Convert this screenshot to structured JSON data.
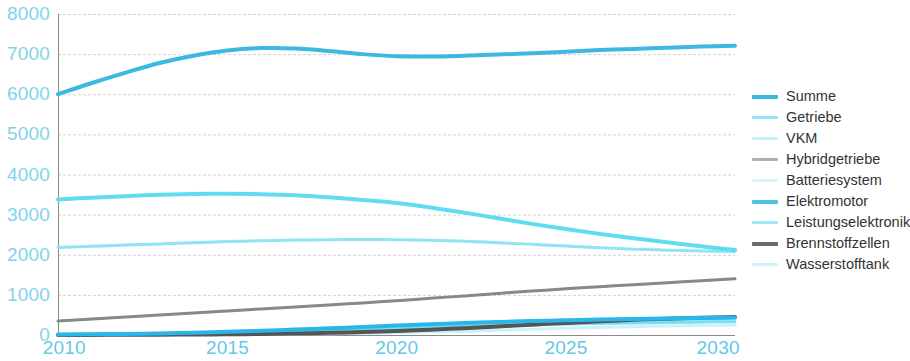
{
  "chart_data": {
    "type": "line",
    "title": "",
    "subtitle": "",
    "xlabel": "",
    "ylabel": "",
    "xlim": [
      2010,
      2030
    ],
    "ylim": [
      0,
      8000
    ],
    "x_ticks": [
      "2010",
      "2015",
      "2020",
      "2025",
      "2030"
    ],
    "x_tick_values": [
      2010,
      2015,
      2020,
      2025,
      2030
    ],
    "y_ticks": [
      "0",
      "1000",
      "2000",
      "3000",
      "4000",
      "5000",
      "6000",
      "7000",
      "8000"
    ],
    "y_tick_values": [
      0,
      1000,
      2000,
      3000,
      4000,
      5000,
      6000,
      7000,
      8000
    ],
    "grid": true,
    "grid_axis": "y",
    "legend_position": "right",
    "x": [
      2010,
      2011,
      2012,
      2013,
      2014,
      2015,
      2016,
      2017,
      2018,
      2019,
      2020,
      2021,
      2022,
      2023,
      2024,
      2025,
      2026,
      2027,
      2028,
      2029,
      2030
    ],
    "series": [
      {
        "name": "Summe",
        "color": "#3cb9e0",
        "width": 4,
        "values": [
          6000,
          6280,
          6540,
          6780,
          6960,
          7090,
          7150,
          7140,
          7080,
          7000,
          6950,
          6940,
          6960,
          6990,
          7020,
          7060,
          7100,
          7130,
          7160,
          7190,
          7210
        ]
      },
      {
        "name": "Getriebe",
        "color": "#8fe4f4",
        "width": 3,
        "values": [
          2180,
          2210,
          2240,
          2270,
          2300,
          2330,
          2350,
          2365,
          2375,
          2380,
          2375,
          2360,
          2335,
          2300,
          2260,
          2215,
          2175,
          2140,
          2115,
          2095,
          2080
        ]
      },
      {
        "name": "VKM",
        "color": "#5fdcf0",
        "width": 4,
        "values": [
          3380,
          3420,
          3460,
          3495,
          3515,
          3520,
          3510,
          3480,
          3430,
          3365,
          3290,
          3180,
          3050,
          2910,
          2770,
          2640,
          2520,
          2410,
          2310,
          2210,
          2120
        ]
      },
      {
        "name": "Hybridgetriebe",
        "color": "#888888",
        "width": 3,
        "values": [
          350,
          400,
          450,
          500,
          550,
          600,
          650,
          700,
          750,
          800,
          855,
          915,
          975,
          1035,
          1095,
          1150,
          1205,
          1255,
          1305,
          1355,
          1400
        ]
      },
      {
        "name": "Batteriesystem",
        "color": "#b8eef8",
        "width": 3,
        "values": [
          20,
          25,
          32,
          42,
          55,
          72,
          92,
          116,
          142,
          170,
          200,
          228,
          254,
          278,
          300,
          320,
          338,
          354,
          368,
          380,
          390
        ]
      },
      {
        "name": "Elektromotor",
        "color": "#29b6e8",
        "width": 4,
        "values": [
          15,
          20,
          28,
          40,
          56,
          78,
          104,
          134,
          166,
          200,
          234,
          266,
          296,
          322,
          346,
          366,
          384,
          400,
          414,
          426,
          436
        ]
      },
      {
        "name": "Leistungselektronik",
        "color": "#77dff2",
        "width": 3,
        "values": [
          12,
          16,
          22,
          31,
          43,
          58,
          76,
          97,
          120,
          145,
          170,
          194,
          217,
          238,
          257,
          274,
          289,
          302,
          314,
          324,
          332
        ]
      },
      {
        "name": "Brennstoffzellen",
        "color": "#555555",
        "width": 4,
        "values": [
          2,
          3,
          5,
          8,
          12,
          18,
          26,
          38,
          54,
          74,
          100,
          132,
          170,
          212,
          258,
          302,
          342,
          378,
          408,
          432,
          450
        ]
      },
      {
        "name": "Wasserstofftank",
        "color": "#cdf1fa",
        "width": 3,
        "values": [
          1,
          2,
          3,
          5,
          8,
          12,
          17,
          24,
          33,
          44,
          58,
          75,
          95,
          118,
          142,
          166,
          188,
          208,
          226,
          240,
          252
        ]
      }
    ]
  },
  "axis": {
    "y_labels": [
      "8000",
      "7000",
      "6000",
      "5000",
      "4000",
      "3000",
      "2000",
      "1000",
      "0"
    ],
    "x_labels": [
      "2010",
      "2015",
      "2020",
      "2025",
      "2030"
    ]
  },
  "legend": {
    "items": [
      {
        "label": "Summe",
        "color": "#3cb9e0",
        "thickness": "4px"
      },
      {
        "label": "Getriebe",
        "color": "#8fe4f4",
        "thickness": "3px"
      },
      {
        "label": "VKM",
        "color": "#c9f0fa",
        "thickness": "3px"
      },
      {
        "label": "Hybridgetriebe",
        "color": "#b0b0b0",
        "thickness": "3px"
      },
      {
        "label": "Batteriesystem",
        "color": "#d8f4fb",
        "thickness": "3px"
      },
      {
        "label": "Elektromotor",
        "color": "#4cc4e8",
        "thickness": "4px"
      },
      {
        "label": "Leistungselektronik",
        "color": "#9de8f6",
        "thickness": "3px"
      },
      {
        "label": "Brennstoffzellen",
        "color": "#6b6b6b",
        "thickness": "4px"
      },
      {
        "label": "Wasserstofftank",
        "color": "#d0f2fb",
        "thickness": "3px"
      }
    ]
  },
  "colors": {
    "axis_text": "#63c9e6",
    "grid": "#9b9b9b",
    "legend_text": "#333333",
    "background": "#ffffff"
  }
}
